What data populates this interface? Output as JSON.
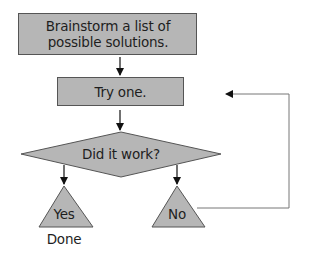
{
  "diagram": {
    "type": "flowchart",
    "colors": {
      "fill": "#b6b6b6",
      "stroke": "#555555",
      "line": "#777777",
      "text": "#1e1e1e"
    },
    "nodes": [
      {
        "id": "brainstorm",
        "shape": "rectangle",
        "label": "Brainstorm a list of possible solutions."
      },
      {
        "id": "try",
        "shape": "rectangle",
        "label": "Try one."
      },
      {
        "id": "decision",
        "shape": "diamond",
        "label": "Did it work?"
      },
      {
        "id": "yes",
        "shape": "triangle",
        "label": "Yes"
      },
      {
        "id": "no",
        "shape": "triangle",
        "label": "No"
      }
    ],
    "annotations": {
      "done": "Done"
    },
    "edges": [
      {
        "from": "brainstorm",
        "to": "try"
      },
      {
        "from": "try",
        "to": "decision"
      },
      {
        "from": "decision",
        "to": "yes"
      },
      {
        "from": "decision",
        "to": "no"
      },
      {
        "from": "no",
        "to": "try",
        "label": ""
      }
    ]
  }
}
